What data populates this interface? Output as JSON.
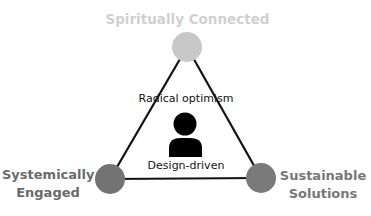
{
  "diagram": {
    "type": "triangle",
    "vertices": [
      {
        "id": "top",
        "label": "Spiritually Connected",
        "color": "#c8c8c8"
      },
      {
        "id": "bottom_left",
        "label_line1": "Systemically",
        "label_line2": "Engaged",
        "color": "#737373"
      },
      {
        "id": "bottom_right",
        "label_line1": "Sustainable",
        "label_line2": "Solutions",
        "color": "#7a7a7a"
      }
    ],
    "center": {
      "icon": "person-icon",
      "top_text": "Radical optimism",
      "bottom_text": "Design-driven"
    },
    "edge_color": "#111111"
  }
}
